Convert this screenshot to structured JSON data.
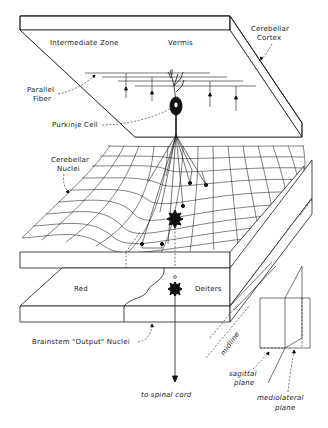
{
  "figure": {
    "type": "anatomical-schematic",
    "colors": {
      "ink": "#1a1a1a",
      "background": "#ffffff"
    }
  },
  "labels": {
    "intermediate_zone": "Intermediate Zone",
    "vermis": "Vermis",
    "cerebellar_cortex_1": "Cerebellar",
    "cerebellar_cortex_2": "Cortex",
    "parallel_fiber_1": "Parallel",
    "parallel_fiber_2": "Fiber",
    "purkinje_cell": "Purkinje Cell",
    "cerebellar_nuclei_1": "Cerebellar",
    "cerebellar_nuclei_2": "Nuclei",
    "red": "Red",
    "deiters": "Deiters",
    "brainstem_output_nuclei": "Brainstem \"Output\" Nuclei",
    "midline": "midline",
    "to_spinal_cord": "to spinal cord",
    "sagittal_plane_1": "sagittal",
    "sagittal_plane_2": "plane",
    "mediolateral_plane_1": "mediolateral",
    "mediolateral_plane_2": "plane"
  },
  "layers": [
    {
      "name": "cerebellar-cortex",
      "regions": [
        "Intermediate Zone",
        "Vermis"
      ]
    },
    {
      "name": "cerebellar-nuclei",
      "representation": "warped mesh surface"
    },
    {
      "name": "brainstem-output-nuclei",
      "regions": [
        "Red",
        "Deiters"
      ]
    }
  ],
  "icons": {
    "purkinje_cell": "neuron-soma",
    "nucleus_cell": "star-neuron",
    "deiters_cell": "star-neuron",
    "spinal_arrow": "arrow-down"
  }
}
